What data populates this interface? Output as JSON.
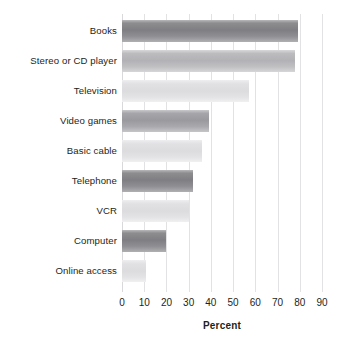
{
  "chart_data": {
    "type": "bar",
    "orientation": "horizontal",
    "title": "",
    "xlabel": "Percent",
    "ylabel": "",
    "xlim": [
      0,
      90
    ],
    "xticks": [
      0,
      10,
      20,
      30,
      40,
      50,
      60,
      70,
      80,
      90
    ],
    "grid": true,
    "legend": false,
    "categories": [
      "Books",
      "Stereo or CD player",
      "Television",
      "Video games",
      "Basic cable",
      "Telephone",
      "VCR",
      "Computer",
      "Online access"
    ],
    "values": [
      79,
      78,
      57,
      39,
      36,
      32,
      30,
      20,
      11
    ],
    "bar_tones": [
      "tone-dark",
      "tone-mid",
      "tone-light",
      "tone-medium-dark",
      "tone-light",
      "tone-dark",
      "tone-light",
      "tone-dark",
      "tone-light"
    ],
    "colors": {
      "dark": "#7f7f83",
      "medium_dark": "#9a9a9e",
      "mid": "#b2b2b6",
      "light": "#dcdcde",
      "gridline": "#e2e2e4",
      "text": "#231f20",
      "background": "#ffffff"
    }
  }
}
